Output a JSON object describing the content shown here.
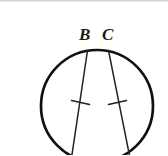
{
  "figure": {
    "background_color": "#ffffff",
    "stroke_color": "#111111",
    "frame": {
      "width": 168,
      "height": 155
    },
    "labels": [
      {
        "name": "B",
        "text": "B",
        "x": 88,
        "y": 38
      },
      {
        "name": "C",
        "text": "C",
        "x": 110,
        "y": 38
      }
    ],
    "circle": {
      "center_x": 97,
      "center_y": 106,
      "radius": 56,
      "stroke_width": 2.6,
      "clipped_at_bottom": true
    },
    "chords": [
      {
        "name": "chord-from-B",
        "from_label": "B",
        "x1": 87.5,
        "y1": 50.5,
        "x2": 70,
        "y2": 168,
        "stroke_width": 1.4,
        "tick": {
          "x": 80.5,
          "y": 103,
          "length": 17,
          "angle_deg": 78
        }
      },
      {
        "name": "chord-from-C",
        "from_label": "C",
        "x1": 108.5,
        "y1": 50.5,
        "x2": 132,
        "y2": 168,
        "stroke_width": 1.4,
        "tick": {
          "x": 117.5,
          "y": 103,
          "length": 17,
          "angle_deg": 102
        }
      }
    ],
    "top_rule_color": "#d2d2d2"
  }
}
